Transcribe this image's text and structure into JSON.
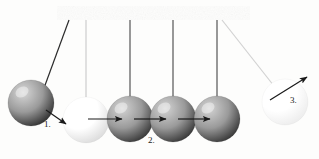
{
  "diagram": {
    "background_color": "#fdfdfc",
    "support_bar": {
      "name": "support-bar",
      "color": "#1c1c1c",
      "x": 57,
      "y": 6,
      "width": 193,
      "height": 14
    },
    "balls": [
      {
        "id": "ball-1",
        "label": "swung-left-dark-ball",
        "cx": 31,
        "cy": 103,
        "r": 23,
        "shade": "dark",
        "fill_light": "#d8d8d8",
        "fill_dark": "#333333",
        "highlight_x": 22,
        "highlight_y": 92
      },
      {
        "id": "ball-2",
        "label": "light-ball",
        "cx": 86,
        "cy": 120,
        "r": 23,
        "shade": "light",
        "fill_light": "#ffffff",
        "fill_dark": "#dcdcdc",
        "highlight_x": 77,
        "highlight_y": 109
      },
      {
        "id": "ball-3",
        "label": "middle-dark-ball-a",
        "cx": 130,
        "cy": 119,
        "r": 23,
        "shade": "dark",
        "fill_light": "#d4d4d4",
        "fill_dark": "#3a3a3a",
        "highlight_x": 121,
        "highlight_y": 108
      },
      {
        "id": "ball-4",
        "label": "middle-dark-ball-b",
        "cx": 173,
        "cy": 119,
        "r": 23,
        "shade": "dark",
        "fill_light": "#d4d4d4",
        "fill_dark": "#3a3a3a",
        "highlight_x": 164,
        "highlight_y": 108
      },
      {
        "id": "ball-5",
        "label": "middle-dark-ball-c",
        "cx": 217,
        "cy": 119,
        "r": 23,
        "shade": "dark",
        "fill_light": "#d4d4d4",
        "fill_dark": "#3a3a3a",
        "highlight_x": 208,
        "highlight_y": 108
      },
      {
        "id": "ball-6",
        "label": "swung-right-pale-ball",
        "cx": 285,
        "cy": 102,
        "r": 23,
        "shade": "pale",
        "fill_light": "#ffffff",
        "fill_dark": "#ededed",
        "highlight_x": 276,
        "highlight_y": 91
      }
    ],
    "strings": [
      {
        "id": "string-1",
        "type": "diagonal-left",
        "x1": 69,
        "y1": 20,
        "x2": 44,
        "y2": 88,
        "color": "#2b2b2b",
        "width": 1.2
      },
      {
        "id": "string-2",
        "type": "vertical",
        "x1": 86,
        "y1": 20,
        "x2": 86,
        "y2": 100,
        "color": "#c9c9c9",
        "width": 1.1
      },
      {
        "id": "string-3",
        "type": "vertical",
        "x1": 130,
        "y1": 20,
        "x2": 130,
        "y2": 99,
        "color": "#555555",
        "width": 1.2
      },
      {
        "id": "string-4",
        "type": "vertical",
        "x1": 173,
        "y1": 20,
        "x2": 173,
        "y2": 99,
        "color": "#555555",
        "width": 1.2
      },
      {
        "id": "string-5",
        "type": "vertical",
        "x1": 217,
        "y1": 20,
        "x2": 217,
        "y2": 99,
        "color": "#555555",
        "width": 1.2
      },
      {
        "id": "string-6",
        "type": "diagonal-right",
        "x1": 222,
        "y1": 20,
        "x2": 274,
        "y2": 86,
        "color": "#d2d2d2",
        "width": 1.2
      }
    ],
    "arrows": [
      {
        "id": "arrow-1",
        "label": "impact-arrow",
        "x1": 46,
        "y1": 110,
        "x2": 66,
        "y2": 124,
        "color": "#1a1a1a"
      },
      {
        "id": "arrow-2",
        "label": "transfer-arrow-a",
        "x1": 88,
        "y1": 119,
        "x2": 122,
        "y2": 119,
        "color": "#1a1a1a"
      },
      {
        "id": "arrow-3",
        "label": "transfer-arrow-b",
        "x1": 134,
        "y1": 119,
        "x2": 166,
        "y2": 119,
        "color": "#1a1a1a"
      },
      {
        "id": "arrow-4",
        "label": "transfer-arrow-c",
        "x1": 178,
        "y1": 119,
        "x2": 210,
        "y2": 119,
        "color": "#1a1a1a"
      },
      {
        "id": "arrow-5",
        "label": "release-arrow",
        "x1": 270,
        "y1": 100,
        "x2": 307,
        "y2": 77,
        "color": "#1a1a1a"
      }
    ],
    "labels": [
      {
        "id": "label-1",
        "text": "1.",
        "x": 44,
        "y": 120
      },
      {
        "id": "label-2",
        "text": "2.",
        "x": 148,
        "y": 136
      },
      {
        "id": "label-3",
        "text": "3.",
        "x": 290,
        "y": 96
      }
    ]
  }
}
